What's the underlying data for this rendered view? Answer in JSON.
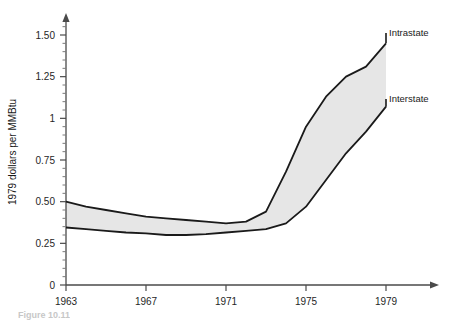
{
  "figure": {
    "caption": "Figure 10.11"
  },
  "chart_data": {
    "type": "area",
    "title": "",
    "subtitle": "",
    "xlabel": "",
    "ylabel": "1979 dollars per MMBtu",
    "xlim": [
      1963,
      1979
    ],
    "ylim": [
      0,
      1.6
    ],
    "grid": false,
    "legend_position": "inline-right",
    "x_ticks": [
      1963,
      1967,
      1971,
      1975,
      1979
    ],
    "x_tick_labels": [
      "1963",
      "1967",
      "1971",
      "1975",
      "1979"
    ],
    "x_minor_tick_step": 1,
    "y_ticks": [
      0,
      0.25,
      0.5,
      0.75,
      1,
      1.25,
      1.5
    ],
    "y_tick_labels": [
      "0",
      "0.25",
      "0.50",
      "0.75",
      "1",
      "1.25",
      "1.50"
    ],
    "y_minor_tick_step": 0.05,
    "fill_between": true,
    "fill_color": "#e6e6e6",
    "line_color": "#1a1a1a",
    "x": [
      1963,
      1964,
      1965,
      1966,
      1967,
      1968,
      1969,
      1970,
      1971,
      1972,
      1973,
      1974,
      1975,
      1976,
      1977,
      1978,
      1979
    ],
    "series": [
      {
        "name": "Intrastate",
        "label": "Intrastate",
        "position": "upper",
        "values": [
          0.5,
          0.47,
          0.45,
          0.43,
          0.41,
          0.4,
          0.39,
          0.38,
          0.37,
          0.38,
          0.44,
          0.68,
          0.95,
          1.13,
          1.25,
          1.31,
          1.45
        ]
      },
      {
        "name": "Interstate",
        "label": "Interstate",
        "position": "lower",
        "values": [
          0.345,
          0.335,
          0.325,
          0.315,
          0.31,
          0.3,
          0.3,
          0.305,
          0.315,
          0.325,
          0.335,
          0.37,
          0.47,
          0.63,
          0.79,
          0.92,
          1.07
        ]
      }
    ]
  }
}
